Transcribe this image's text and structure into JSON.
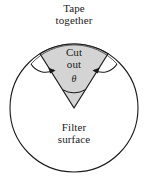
{
  "figure": {
    "title_labels": {
      "tape": "Tape\ntogether",
      "cut_out": "Cut\nout",
      "theta": "θ",
      "filter_surface": "Filter\nsurface"
    },
    "colors": {
      "wedge_fill": "#d4d4d4",
      "stroke": "#1a1a1a",
      "background": "#ffffff",
      "text": "#1a1a1a"
    },
    "geometry": {
      "circle_center_x": 74,
      "circle_center_y": 108,
      "circle_radius": 64,
      "wedge_apex_x": 74,
      "wedge_apex_y": 108,
      "wedge_left_corner_x": 40,
      "wedge_left_corner_y": 46,
      "wedge_right_corner_x": 108,
      "wedge_right_corner_y": 46,
      "wedge_angle_degrees": 60
    }
  }
}
